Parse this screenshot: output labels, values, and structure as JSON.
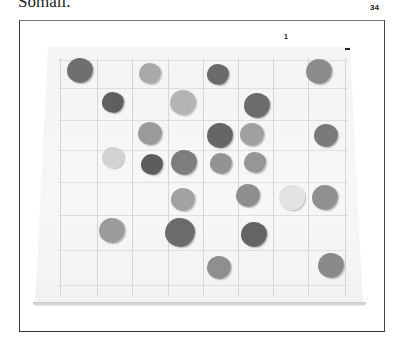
{
  "page": {
    "caption_fragment": "Somali.",
    "page_number": "34",
    "figure_label": "1"
  },
  "figure": {
    "board": {
      "grid_columns": 6,
      "grid_rows": 5
    },
    "stones": [
      {
        "x": 80,
        "y": 71,
        "r": 13,
        "color": "#6f6f6f"
      },
      {
        "x": 150,
        "y": 74,
        "r": 11,
        "color": "#a9a9a9"
      },
      {
        "x": 218,
        "y": 75,
        "r": 11,
        "color": "#6a6a6a"
      },
      {
        "x": 319,
        "y": 72,
        "r": 13,
        "color": "#8c8c8c"
      },
      {
        "x": 113,
        "y": 103,
        "r": 11,
        "color": "#5f5f5f"
      },
      {
        "x": 183,
        "y": 103,
        "r": 13,
        "color": "#b4b4b4"
      },
      {
        "x": 257,
        "y": 106,
        "r": 13,
        "color": "#6c6c6c"
      },
      {
        "x": 150,
        "y": 134,
        "r": 12,
        "color": "#9a9a9a"
      },
      {
        "x": 220,
        "y": 136,
        "r": 13,
        "color": "#666666"
      },
      {
        "x": 252,
        "y": 135,
        "r": 12,
        "color": "#a0a0a0"
      },
      {
        "x": 326,
        "y": 136,
        "r": 12,
        "color": "#7a7a7a"
      },
      {
        "x": 113,
        "y": 158,
        "r": 11,
        "color": "#d2d2d2"
      },
      {
        "x": 152,
        "y": 165,
        "r": 11,
        "color": "#5d5d5d"
      },
      {
        "x": 184,
        "y": 163,
        "r": 13,
        "color": "#7e7e7e"
      },
      {
        "x": 221,
        "y": 164,
        "r": 11,
        "color": "#939393"
      },
      {
        "x": 255,
        "y": 163,
        "r": 11,
        "color": "#969696"
      },
      {
        "x": 183,
        "y": 200,
        "r": 12,
        "color": "#a2a2a2"
      },
      {
        "x": 248,
        "y": 196,
        "r": 12,
        "color": "#8e8e8e"
      },
      {
        "x": 292,
        "y": 198,
        "r": 13,
        "color": "#e2e2e2"
      },
      {
        "x": 325,
        "y": 198,
        "r": 13,
        "color": "#909090"
      },
      {
        "x": 112,
        "y": 231,
        "r": 13,
        "color": "#9c9c9c"
      },
      {
        "x": 180,
        "y": 233,
        "r": 15,
        "color": "#6b6b6b"
      },
      {
        "x": 254,
        "y": 235,
        "r": 13,
        "color": "#646464"
      },
      {
        "x": 219,
        "y": 268,
        "r": 12,
        "color": "#8f8f8f"
      },
      {
        "x": 331,
        "y": 266,
        "r": 13,
        "color": "#8a8a8a"
      }
    ]
  }
}
